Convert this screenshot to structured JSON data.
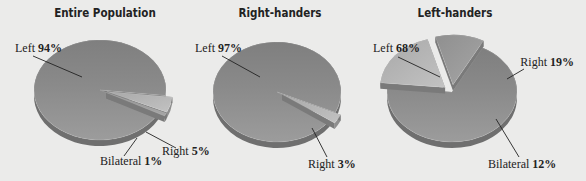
{
  "chart_data": [
    {
      "type": "pie",
      "title": "Entire Population",
      "slices": [
        {
          "label": "Left",
          "value": 94,
          "display": "94%",
          "exploded": false
        },
        {
          "label": "Right",
          "value": 5,
          "display": "5%",
          "exploded": true
        },
        {
          "label": "Bilateral",
          "value": 1,
          "display": "1%",
          "exploded": true
        }
      ]
    },
    {
      "type": "pie",
      "title": "Right-handers",
      "slices": [
        {
          "label": "Left",
          "value": 97,
          "display": "97%",
          "exploded": false
        },
        {
          "label": "Right",
          "value": 3,
          "display": "3%",
          "exploded": true
        }
      ]
    },
    {
      "type": "pie",
      "title": "Left-handers",
      "slices": [
        {
          "label": "Left",
          "value": 68,
          "display": "68%",
          "exploded": false
        },
        {
          "label": "Right",
          "value": 19,
          "display": "19%",
          "exploded": true
        },
        {
          "label": "Bilateral",
          "value": 12,
          "display": "12%",
          "exploded": true
        }
      ]
    }
  ],
  "colors": {
    "background": "#ebebea",
    "left_slice": "#8c8c8c",
    "right_slice": "#b4b4b4",
    "bilateral_slice": "#9a9a9a",
    "text": "#222222"
  }
}
